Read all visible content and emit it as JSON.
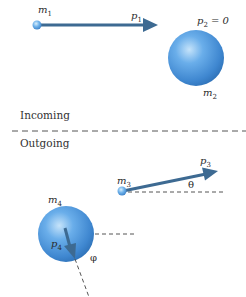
{
  "diagram": {
    "colors": {
      "ball": "#4a90d9",
      "ball_highlight": "#b9dcf7",
      "ball_shadow": "#2f6fb3",
      "arrow": "#3d6a92",
      "dash": "#555555",
      "text": "#2a2a2a"
    },
    "incoming": {
      "section_label": "Incoming",
      "particle1": {
        "mass": "m",
        "mass_sub": "1",
        "momentum": "p",
        "momentum_sub": "1"
      },
      "particle2": {
        "mass": "m",
        "mass_sub": "2",
        "momentum": "p",
        "momentum_sub": "2",
        "momentum_value": " = 0"
      }
    },
    "outgoing": {
      "section_label": "Outgoing",
      "particle3": {
        "mass": "m",
        "mass_sub": "3",
        "momentum": "p",
        "momentum_sub": "3",
        "angle": "θ"
      },
      "particle4": {
        "mass": "m",
        "mass_sub": "4",
        "momentum": "p",
        "momentum_sub": "4",
        "angle": "φ"
      }
    }
  }
}
